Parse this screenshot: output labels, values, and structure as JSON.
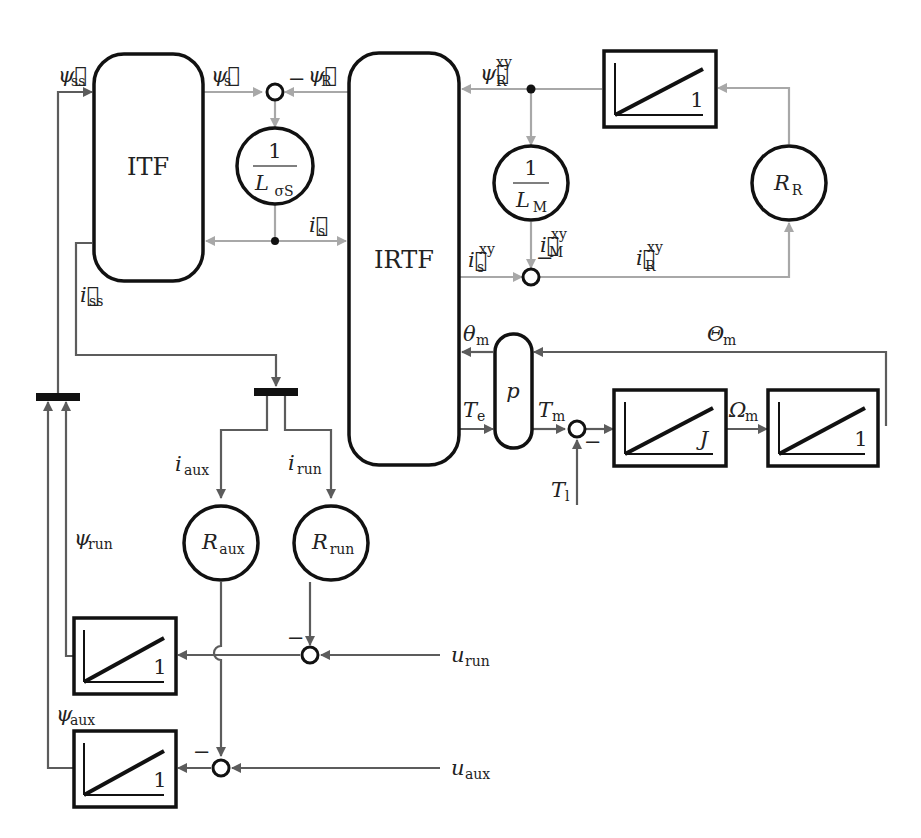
{
  "diagram": {
    "title": "",
    "blocks": {
      "itf": {
        "label": "ITF"
      },
      "irtf": {
        "label": "IRTF"
      },
      "p": {
        "label": "p"
      },
      "inv_lsigma": {
        "num": "1",
        "den": "L",
        "den_sub": "σS"
      },
      "inv_lm": {
        "num": "1",
        "den": "L",
        "den_sub": "M"
      },
      "rr": {
        "main": "R",
        "sub": "R"
      },
      "raux": {
        "main": "R",
        "sub": "aux"
      },
      "rrun": {
        "main": "R",
        "sub": "run"
      },
      "int_rotor": {
        "gain": "1"
      },
      "int_j": {
        "gain": "J"
      },
      "int_theta": {
        "gain": "1"
      },
      "int_run": {
        "gain": "1"
      },
      "int_aux": {
        "gain": "1"
      }
    },
    "signals": {
      "psi_ss": {
        "main": "ψ⃗",
        "sub": "ss"
      },
      "psi_s": {
        "main": "ψ⃗",
        "sub": "s"
      },
      "psi_R": {
        "main": "ψ⃗",
        "sub": "R"
      },
      "psi_R_xy": {
        "main": "ψ⃗",
        "sub": "R",
        "sup": "xy"
      },
      "i_s": {
        "main": "i⃗",
        "sub": "s"
      },
      "i_ss": {
        "main": "i⃗",
        "sub": "ss"
      },
      "i_s_xy": {
        "main": "i⃗",
        "sub": "s",
        "sup": "xy"
      },
      "i_M_xy": {
        "main": "i⃗",
        "sub": "M",
        "sup": "xy"
      },
      "i_R_xy": {
        "main": "i⃗",
        "sub": "R",
        "sup": "xy"
      },
      "theta_m": {
        "main": "θ",
        "sub": "m"
      },
      "Theta_m": {
        "main": "Θ",
        "sub": "m"
      },
      "T_e": {
        "main": "T",
        "sub": "e"
      },
      "T_m": {
        "main": "T",
        "sub": "m"
      },
      "T_l": {
        "main": "T",
        "sub": "l"
      },
      "Omega_m": {
        "main": "Ω",
        "sub": "m"
      },
      "i_aux": {
        "main": "i",
        "sub": "aux"
      },
      "i_run": {
        "main": "i",
        "sub": "run"
      },
      "psi_run": {
        "main": "ψ",
        "sub": "run"
      },
      "psi_aux": {
        "main": "ψ",
        "sub": "aux"
      },
      "u_run": {
        "main": "u",
        "sub": "run"
      },
      "u_aux": {
        "main": "u",
        "sub": "aux"
      }
    },
    "signs": {
      "minus": "−"
    },
    "colors": {
      "block_stroke": "#111111",
      "vector_signal": "#a8a8a8",
      "scalar_signal": "#5c5c5c"
    }
  }
}
